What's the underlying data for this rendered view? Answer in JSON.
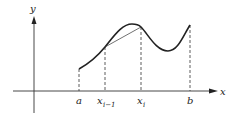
{
  "figure": {
    "axes": {
      "x_label": "x",
      "y_label": "y"
    },
    "tick_labels": {
      "a": "a",
      "x_prev_base": "x",
      "x_prev_sub": "i−1",
      "x_i_base": "x",
      "x_i_sub": "i",
      "b": "b"
    },
    "colors": {
      "stroke": "#222222",
      "background": "#ffffff"
    }
  }
}
